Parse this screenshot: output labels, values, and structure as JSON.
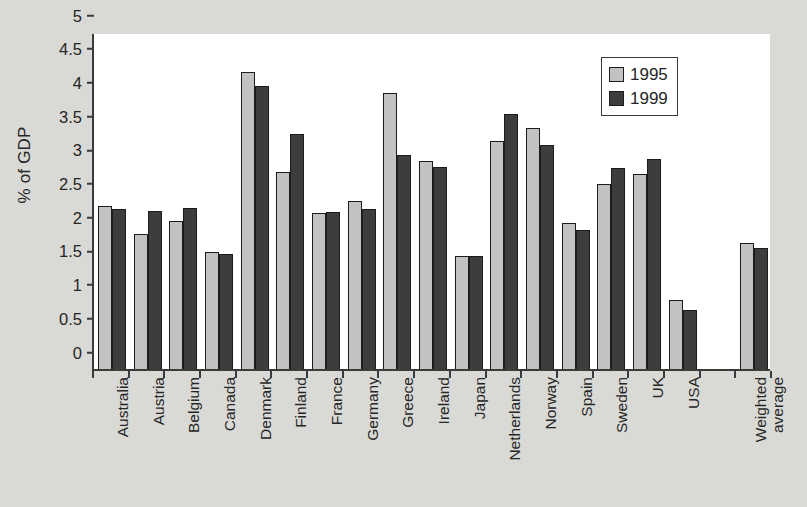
{
  "chart_data": {
    "type": "bar",
    "title": "",
    "xlabel": "",
    "ylabel": "% of GDP",
    "ylim": [
      0,
      5
    ],
    "ytick_step": 0.5,
    "yticks": [
      "0",
      "0.5",
      "1",
      "1.5",
      "2",
      "2.5",
      "3",
      "3.5",
      "4",
      "4.5",
      "5"
    ],
    "grid": false,
    "legend_position": "top-right",
    "categories": [
      "Australia",
      "Austria",
      "Belgium",
      "Canada",
      "Denmark",
      "Finland",
      "France",
      "Germany",
      "Greece",
      "Ireland",
      "Japan",
      "Netherlands",
      "Norway",
      "Spain",
      "Sweden",
      "UK",
      "USA",
      "",
      "Weighted average"
    ],
    "series": [
      {
        "name": "1995",
        "color": "#c2c2c2",
        "values": [
          2.42,
          2.0,
          2.2,
          1.74,
          4.4,
          2.92,
          2.31,
          2.49,
          4.1,
          3.09,
          1.68,
          3.38,
          3.58,
          2.16,
          2.74,
          2.89,
          1.02,
          null,
          1.87
        ]
      },
      {
        "name": "1999",
        "color": "#3d3d3d",
        "values": [
          2.38,
          2.35,
          2.39,
          1.71,
          4.2,
          3.48,
          2.33,
          2.38,
          3.18,
          2.99,
          1.68,
          3.78,
          3.33,
          2.06,
          2.98,
          3.12,
          0.88,
          null,
          1.79
        ]
      }
    ]
  },
  "legend": {
    "entries": [
      {
        "label": "1995",
        "color": "#c2c2c2"
      },
      {
        "label": "1999",
        "color": "#3d3d3d"
      }
    ]
  },
  "colors": {
    "background": "#d9d9d5",
    "plot_background": "#ffffff",
    "axis": "#3a3a3a",
    "text": "#262626",
    "series_1995": "#c2c2c2",
    "series_1999": "#3d3d3d"
  }
}
